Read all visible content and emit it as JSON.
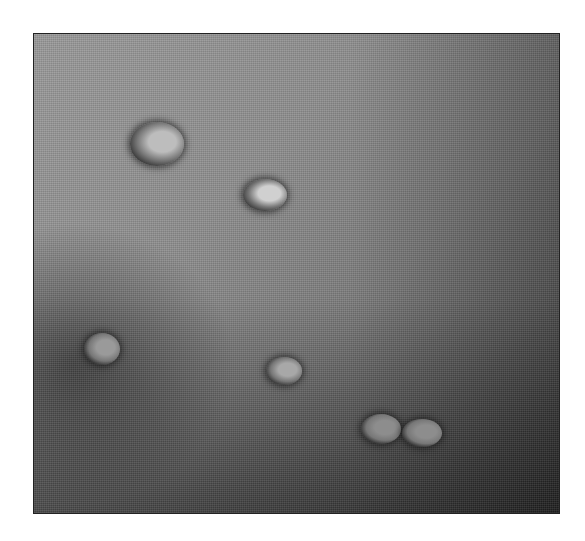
{
  "image": {
    "description": "Grayscale micrograph showing seven oval cells/particles on a textured gray background",
    "frame": {
      "x": 33,
      "y": 33,
      "width": 525,
      "height": 479
    },
    "cells": [
      {
        "cx": 156,
        "cy": 143,
        "rx": 27,
        "ry": 22,
        "ring": "#2a2a2a",
        "core": "#bdbdbd"
      },
      {
        "cx": 264,
        "cy": 194,
        "rx": 22,
        "ry": 16,
        "ring": "#2e2e2e",
        "core": "#d0d0d0"
      },
      {
        "cx": 101,
        "cy": 348,
        "rx": 18,
        "ry": 16,
        "ring": "#1e1e1e",
        "core": "#9a9a9a"
      },
      {
        "cx": 283,
        "cy": 370,
        "rx": 18,
        "ry": 14,
        "ring": "#262626",
        "core": "#a8a8a8"
      },
      {
        "cx": 380,
        "cy": 428,
        "rx": 20,
        "ry": 15,
        "ring": "#1c1c1c",
        "core": "#8d8d8d"
      },
      {
        "cx": 421,
        "cy": 432,
        "rx": 20,
        "ry": 14,
        "ring": "#1c1c1c",
        "core": "#8d8d8d"
      }
    ]
  }
}
